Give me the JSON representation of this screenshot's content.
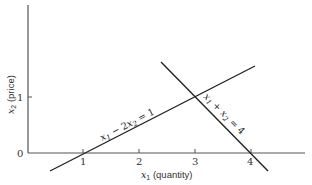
{
  "diagram": {
    "x_axis": {
      "label_var": "x",
      "label_sub": "1",
      "label_text": " (quantity)",
      "ticks": [
        "1",
        "2",
        "3",
        "4"
      ]
    },
    "y_axis": {
      "label_var": "x",
      "label_sub": "2",
      "label_text": " (price)",
      "ticks": [
        "0",
        "1"
      ]
    },
    "lines": [
      {
        "name": "supply",
        "equation_parts": [
          "x",
          "1",
          " − 2",
          "x",
          "2",
          " = 1"
        ],
        "color": "#222222"
      },
      {
        "name": "demand",
        "equation_parts": [
          "x",
          "1",
          " + ",
          "x",
          "2",
          " = 4"
        ],
        "color": "#222222"
      }
    ],
    "intersection": {
      "x1": 3,
      "x2": 1
    }
  }
}
